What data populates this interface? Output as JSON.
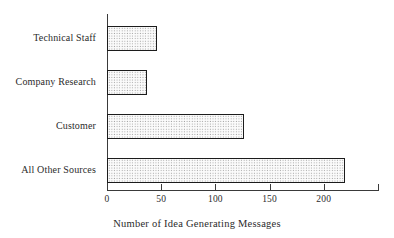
{
  "chart_data": {
    "type": "bar",
    "orientation": "horizontal",
    "title": "",
    "xlabel": "Number of Idea Generating Messages",
    "ylabel": "",
    "categories": [
      "Technical Staff",
      "Company Research",
      "Customer",
      "All Other Sources"
    ],
    "values": [
      46,
      37,
      126,
      220
    ],
    "xlim": [
      0,
      250
    ],
    "xticks": [
      0,
      50,
      100,
      150,
      200,
      250
    ],
    "xtick_labels": [
      "0",
      "50",
      "100",
      "150",
      "200",
      ""
    ],
    "grid": false,
    "legend": null,
    "bar_facecolor": "#fbfbfb",
    "bar_edgecolor": "#1c1c1c",
    "bar_hatch": "dotted-stipple",
    "background": "#ffffff",
    "axis_color": "#3a3a3a"
  },
  "axis": {
    "x_title": "Number of Idea Generating Messages",
    "ticks": [
      {
        "value": 0,
        "label": "0"
      },
      {
        "value": 50,
        "label": "50"
      },
      {
        "value": 100,
        "label": "100"
      },
      {
        "value": 150,
        "label": "150"
      },
      {
        "value": 200,
        "label": "200"
      },
      {
        "value": 250,
        "label": ""
      }
    ]
  },
  "bars": [
    {
      "label": "Technical Staff",
      "value": 46
    },
    {
      "label": "Company Research",
      "value": 37
    },
    {
      "label": "Customer",
      "value": 126
    },
    {
      "label": "All Other Sources",
      "value": 220
    }
  ]
}
